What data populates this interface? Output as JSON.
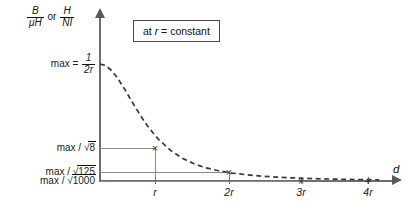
{
  "figure": {
    "background": "#ffffff",
    "line_color": "#6e6e6e",
    "guide_color": "#8a8a8a",
    "curve_color": "#3a3a3a",
    "text_color": "#111111"
  },
  "axes": {
    "y_title_parts": {
      "frac1_num": "B",
      "frac1_den_mu": "μ",
      "frac1_den_h": "H",
      "conjunction": "or",
      "frac2_num": "H",
      "frac2_den": "NI"
    },
    "x_title": "d",
    "x_ticks": [
      {
        "label": "r",
        "x": 155
      },
      {
        "label": "2r",
        "x": 229
      },
      {
        "label": "3r",
        "x": 301
      },
      {
        "label": "4r",
        "x": 368
      }
    ],
    "y_levels": [
      {
        "id": "max",
        "prefix": "max =",
        "kind": "fraction",
        "num": "1",
        "den": "2r",
        "y": 64
      },
      {
        "id": "max-over-sqrt8",
        "prefix": "max /",
        "kind": "sqrt",
        "radicand": "8",
        "y": 148
      },
      {
        "id": "max-over-sqrt125",
        "prefix": "max /",
        "kind": "sqrt",
        "radicand": "125",
        "y": 172
      },
      {
        "id": "max-over-sqrt1000",
        "prefix": "max /",
        "kind": "sqrt",
        "radicand": "1000",
        "y": 181
      }
    ]
  },
  "annotation": {
    "prefix": "at",
    "variable": "r",
    "equals": "=",
    "value": "constant"
  },
  "markers": [
    {
      "glyph": "×",
      "x": 155,
      "y": 148
    },
    {
      "glyph": "×",
      "x": 229,
      "y": 172
    },
    {
      "glyph": "×",
      "x": 301,
      "y": 181
    },
    {
      "glyph": "+",
      "x": 368,
      "y": 181
    }
  ],
  "guides": [
    {
      "name": "guide-h-sqrt8",
      "orientation": "h",
      "x": 100,
      "y": 148,
      "length": 56
    },
    {
      "name": "guide-h-sqrt125",
      "orientation": "h",
      "x": 100,
      "y": 172,
      "length": 130
    },
    {
      "name": "guide-h-sqrt1000",
      "orientation": "h",
      "x": 100,
      "y": 181,
      "length": 202
    },
    {
      "name": "guide-v-r",
      "orientation": "v",
      "x": 155,
      "y": 148,
      "length": 33
    },
    {
      "name": "guide-v-2r",
      "orientation": "v",
      "x": 229,
      "y": 172,
      "length": 9
    }
  ],
  "chart_data": {
    "type": "line",
    "title": "",
    "subtitle": "at r = constant",
    "xlabel": "d",
    "ylabel": "B/μH or H/NI",
    "grid": false,
    "legend": null,
    "line_style": "dashed",
    "xlim": [
      0,
      4.9
    ],
    "ylim": [
      0,
      1.12
    ],
    "x_tick_labels": [
      "r",
      "2r",
      "3r",
      "4r"
    ],
    "x_tick_values": [
      1,
      2,
      3,
      4
    ],
    "y_tick_labels": [
      "max = 1/2r",
      "max / √8",
      "max / √125",
      "max / √1000"
    ],
    "y_tick_values": [
      1.0,
      0.3536,
      0.0894,
      0.0316
    ],
    "y_tick_expressions": [
      "1",
      "1/√8",
      "1/√125",
      "1/√1000"
    ],
    "formula": "y = max / sqrt((1 + (d/r)^2)^3)",
    "series": [
      {
        "name": "B/μH",
        "x": [
          0,
          0.1,
          0.2,
          0.3,
          0.4,
          0.5,
          0.6,
          0.7,
          0.8,
          0.9,
          1.0,
          1.2,
          1.4,
          1.6,
          1.8,
          2.0,
          2.25,
          2.5,
          2.75,
          3.0,
          3.25,
          3.5,
          3.75,
          4.0,
          4.25,
          4.5,
          4.75
        ],
        "y": [
          1.0,
          0.985,
          0.943,
          0.879,
          0.801,
          0.716,
          0.631,
          0.551,
          0.477,
          0.412,
          0.354,
          0.262,
          0.195,
          0.147,
          0.113,
          0.0894,
          0.068,
          0.0527,
          0.0417,
          0.0335,
          0.0273,
          0.0226,
          0.0189,
          0.016,
          0.0136,
          0.0117,
          0.0101
        ]
      }
    ],
    "annotated_points": [
      {
        "x": 1,
        "y": 0.3536,
        "label": "max / √8",
        "marker": "×"
      },
      {
        "x": 2,
        "y": 0.0894,
        "label": "max / √125",
        "marker": "×"
      },
      {
        "x": 3,
        "y": 0.0316,
        "label": "max / √1000",
        "marker": "×"
      },
      {
        "x": 4,
        "y": 0.016,
        "label": "",
        "marker": "+"
      }
    ]
  }
}
